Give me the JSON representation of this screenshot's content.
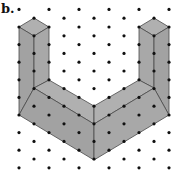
{
  "figure": {
    "label": "b.",
    "colors": {
      "face_top": "#b0b0b0",
      "face_side": "#a8a8a8",
      "face_front": "#a2a2a2",
      "edge": "#4a4a4a",
      "dot": "#111111",
      "background": "#ffffff"
    },
    "dot_grid": {
      "type": "isometric",
      "columns": 11,
      "rows_even_columns": 10,
      "rows_odd_columns": 9
    },
    "shape": {
      "left_tower_top": [
        [
          1,
          1
        ],
        [
          0,
          1
        ],
        [
          1,
          2
        ],
        [
          2,
          1
        ]
      ],
      "right_tower_top": [
        [
          9,
          1
        ],
        [
          8,
          1
        ],
        [
          9,
          2
        ],
        [
          10,
          1
        ]
      ]
    }
  }
}
